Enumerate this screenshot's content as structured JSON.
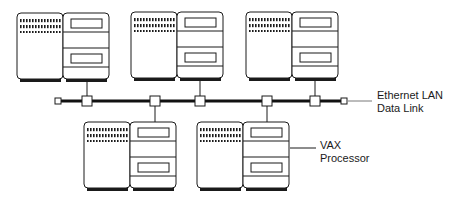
{
  "diagram": {
    "type": "network-topology",
    "labels": {
      "bus": {
        "line1": "Ethernet LAN",
        "line2": "Data Link"
      },
      "node": {
        "line1": "VAX",
        "line2": "Processor"
      }
    },
    "colors": {
      "stroke": "#1a1a1a",
      "background": "#ffffff",
      "bus": "#111111"
    },
    "bus": {
      "y": 101,
      "x_start": 57,
      "x_end": 345
    },
    "nodes": [
      {
        "id": "vax-top-1",
        "position": "top",
        "x": 17,
        "y": 13,
        "tap_x": 87
      },
      {
        "id": "vax-top-2",
        "position": "top",
        "x": 130,
        "y": 12,
        "tap_x": 200
      },
      {
        "id": "vax-top-3",
        "position": "top",
        "x": 244,
        "y": 12,
        "tap_x": 315
      },
      {
        "id": "vax-bottom-1",
        "position": "bottom",
        "x": 83,
        "y": 122,
        "tap_x": 155
      },
      {
        "id": "vax-bottom-2",
        "position": "bottom",
        "x": 196,
        "y": 122,
        "tap_x": 267
      }
    ]
  }
}
